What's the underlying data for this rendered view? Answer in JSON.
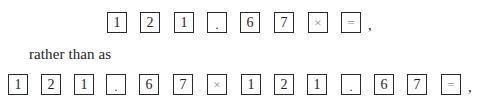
{
  "sequence_short": {
    "keys": [
      {
        "label": "1",
        "kind": "digit"
      },
      {
        "label": "2",
        "kind": "digit"
      },
      {
        "label": "1",
        "kind": "digit"
      },
      {
        "label": ".",
        "kind": "dot"
      },
      {
        "label": "6",
        "kind": "digit"
      },
      {
        "label": "7",
        "kind": "digit"
      },
      {
        "label": "×",
        "kind": "op"
      },
      {
        "label": "=",
        "kind": "op"
      }
    ],
    "trailing": ","
  },
  "connector_text": "rather than as",
  "sequence_long": {
    "keys": [
      {
        "label": "1",
        "kind": "digit"
      },
      {
        "label": "2",
        "kind": "digit"
      },
      {
        "label": "1",
        "kind": "digit"
      },
      {
        "label": ".",
        "kind": "dot"
      },
      {
        "label": "6",
        "kind": "digit"
      },
      {
        "label": "7",
        "kind": "digit"
      },
      {
        "label": "×",
        "kind": "op"
      },
      {
        "label": "1",
        "kind": "digit"
      },
      {
        "label": "2",
        "kind": "digit"
      },
      {
        "label": "1",
        "kind": "digit"
      },
      {
        "label": ".",
        "kind": "dot"
      },
      {
        "label": "6",
        "kind": "digit"
      },
      {
        "label": "7",
        "kind": "digit"
      },
      {
        "label": "=",
        "kind": "op"
      }
    ],
    "trailing": ","
  }
}
